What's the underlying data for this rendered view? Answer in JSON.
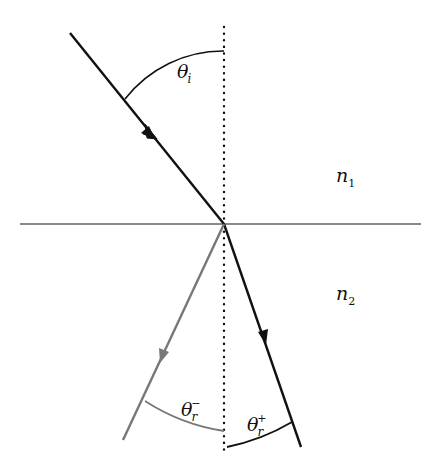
{
  "diagram": {
    "colors": {
      "incident_ray": "#111111",
      "positive_refracted_ray": "#111111",
      "negative_refracted_ray": "#777777",
      "interface": "#8a8a8a",
      "normal": "#111111"
    },
    "labels": {
      "theta_i": {
        "base": "θ",
        "sub": "i"
      },
      "theta_r_minus": {
        "base": "θ",
        "sub": "r",
        "sup": "−"
      },
      "theta_r_plus": {
        "base": "θ",
        "sub": "r",
        "sup": "+"
      },
      "n1": {
        "base": "n",
        "sub": "1"
      },
      "n2": {
        "base": "n",
        "sub": "2"
      }
    },
    "geometry": {
      "interface": {
        "x1": 20,
        "y1": 224,
        "x2": 421,
        "y2": 224
      },
      "normal": {
        "x": 224,
        "y1": 27,
        "y2": 450
      },
      "origin": {
        "x": 224,
        "y": 224
      },
      "incident_ray": {
        "x1": 70,
        "y1": 33,
        "x2": 224,
        "y2": 224
      },
      "positive_refracted_ray": {
        "x1": 224,
        "y1": 224,
        "x2": 301,
        "y2": 447
      },
      "negative_refracted_ray": {
        "x1": 224,
        "y1": 224,
        "x2": 123,
        "y2": 440
      }
    },
    "media": [
      "n1 (upper medium)",
      "n2 (lower medium)"
    ]
  }
}
